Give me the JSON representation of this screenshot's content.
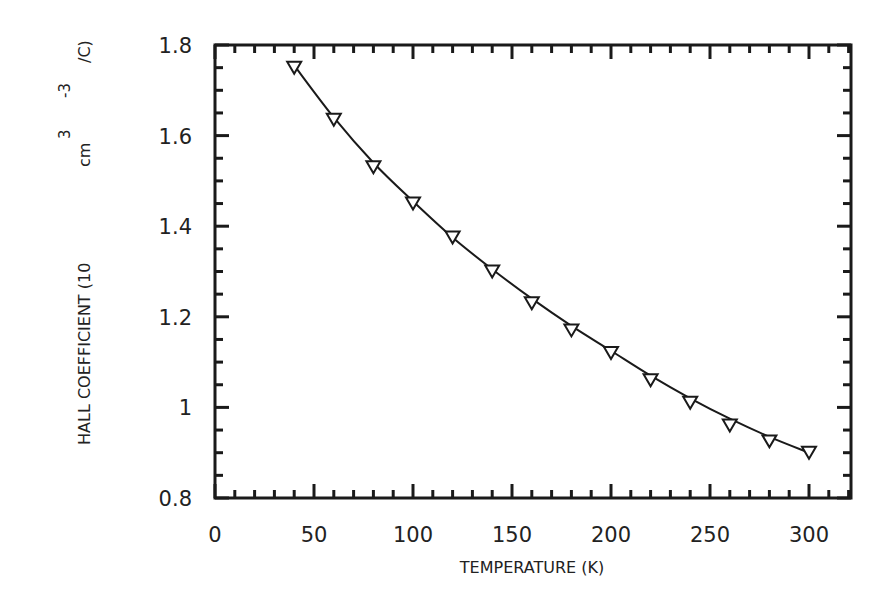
{
  "chart_data": {
    "type": "scatter",
    "title": "",
    "xlabel": "TEMPERATURE (K)",
    "ylabel": "HALL COEFFICIENT (10^-3 cm^3/C)",
    "ylabel_parts": {
      "main": "HALL COEFFICIENT (10",
      "exp1": "-3",
      "mid": "cm",
      "exp2": "3",
      "end": "/C)"
    },
    "xlim": [
      0,
      321
    ],
    "ylim": [
      0.8,
      1.8
    ],
    "x_ticks": [
      0,
      50,
      100,
      150,
      200,
      250,
      300
    ],
    "x_tick_labels": [
      "0",
      "50",
      "100",
      "150",
      "200",
      "250",
      "300"
    ],
    "y_ticks": [
      0.8,
      1.0,
      1.2,
      1.4,
      1.6,
      1.8
    ],
    "y_tick_labels": [
      "0.8",
      "1",
      "1.2",
      "1.4",
      "1.6",
      "1.8"
    ],
    "x_minor_step": 10,
    "y_minor_step": 0.05,
    "grid": false,
    "legend": null,
    "series": [
      {
        "name": "measured",
        "marker": "triangle-down-open",
        "x": [
          40,
          60,
          80,
          100,
          120,
          140,
          160,
          180,
          200,
          220,
          240,
          260,
          280,
          300
        ],
        "values": [
          1.75,
          1.635,
          1.53,
          1.45,
          1.375,
          1.3,
          1.23,
          1.17,
          1.12,
          1.06,
          1.01,
          0.96,
          0.925,
          0.9
        ]
      },
      {
        "name": "fit",
        "style": "solid-line",
        "x": [
          40,
          60,
          80,
          100,
          120,
          140,
          160,
          180,
          200,
          220,
          240,
          260,
          280,
          300
        ],
        "values": [
          1.755,
          1.64,
          1.54,
          1.455,
          1.375,
          1.305,
          1.24,
          1.18,
          1.125,
          1.07,
          1.02,
          0.975,
          0.935,
          0.9
        ]
      }
    ]
  },
  "colors": {
    "axis": "#1a1a1a",
    "line": "#1a1a1a",
    "marker_fill": "#ffffff",
    "background": "#ffffff"
  }
}
